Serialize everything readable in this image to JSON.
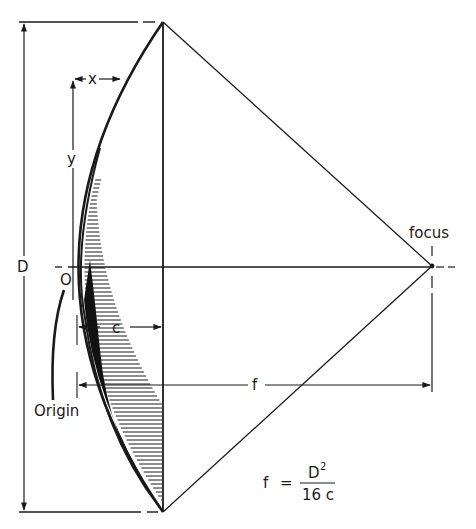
{
  "diagram": {
    "labels": {
      "D": "D",
      "x": "x",
      "y": "y",
      "c": "c",
      "f": "f",
      "O": "O",
      "origin": "Origin",
      "focus": "focus"
    },
    "formula": {
      "lhs": "f",
      "equals": "=",
      "numerator_base": "D",
      "numerator_exponent": "2",
      "denominator": "16 c"
    },
    "colors": {
      "ink": "#1a1a1a",
      "background": "#ffffff"
    }
  }
}
